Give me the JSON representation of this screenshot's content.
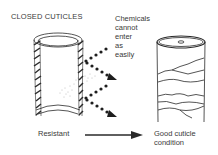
{
  "title": "CLOSED CUTICLES",
  "annotation": {
    "lines": [
      "Chemicals",
      "cannot",
      "enter",
      "as",
      "easily"
    ]
  },
  "bottom": {
    "left_label": "Resistant",
    "right_label_lines": [
      "Good cuticle",
      "condition"
    ]
  },
  "colors": {
    "ink": "#2a2a2a",
    "background": "#ffffff"
  }
}
